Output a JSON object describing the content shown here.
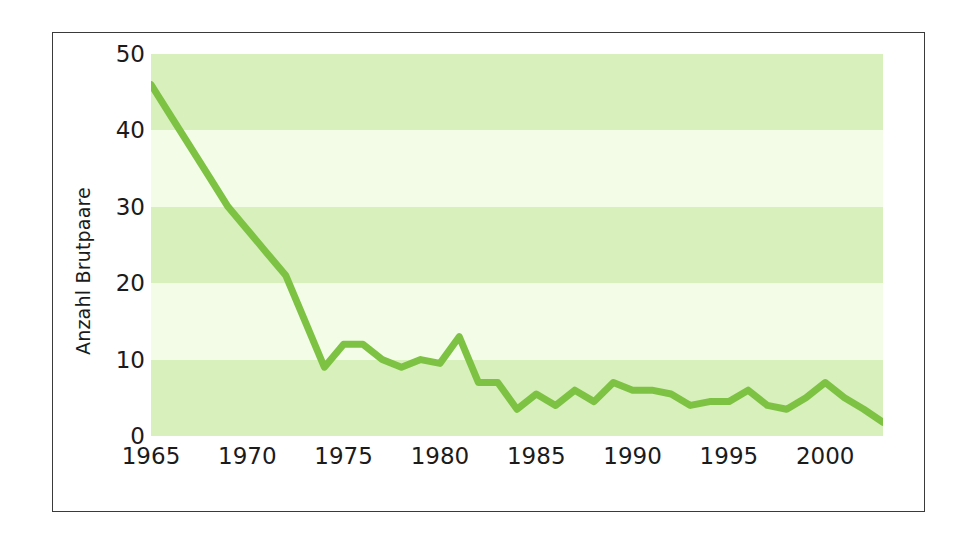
{
  "chart_data": {
    "type": "line",
    "title": "",
    "xlabel": "",
    "ylabel": "Anzahl Brutpaare",
    "xlim": [
      1965,
      2003
    ],
    "ylim": [
      0,
      50
    ],
    "ytick_values": [
      0,
      10,
      20,
      30,
      40,
      50
    ],
    "ytick_labels": [
      "0",
      "10",
      "20",
      "30",
      "40",
      "50"
    ],
    "xtick_values": [
      1965,
      1970,
      1975,
      1980,
      1985,
      1990,
      1995,
      2000
    ],
    "xtick_labels": [
      "1965",
      "1970",
      "1975",
      "1980",
      "1985",
      "1990",
      "1995",
      "2000"
    ],
    "grid": false,
    "banded_background": true,
    "band_interval": 10,
    "legend": null,
    "x": [
      1965,
      1966,
      1967,
      1968,
      1969,
      1970,
      1971,
      1972,
      1973,
      1974,
      1975,
      1976,
      1977,
      1978,
      1979,
      1980,
      1981,
      1982,
      1983,
      1984,
      1985,
      1986,
      1987,
      1988,
      1989,
      1990,
      1991,
      1992,
      1993,
      1994,
      1995,
      1996,
      1997,
      1998,
      1999,
      2000,
      2001,
      2002,
      2003
    ],
    "series": [
      {
        "name": "Anzahl Brutpaare",
        "color": "#7DC242",
        "line_width": 7,
        "values": [
          46,
          42,
          38,
          34,
          30,
          27,
          24,
          21,
          15,
          9,
          12,
          12,
          10,
          9,
          10,
          9.5,
          13,
          7,
          7,
          3.5,
          5.5,
          4,
          6,
          4.5,
          7,
          6,
          6,
          5.5,
          4,
          4.5,
          4.5,
          6,
          4,
          3.5,
          5,
          7,
          5,
          3.5,
          1.8
        ]
      }
    ],
    "colors": {
      "line": "#7DC242",
      "band_dark": "#D8F0BC",
      "band_light": "#F2FCE6",
      "frame": "#3a3a3a",
      "text": "#1b1b1b",
      "background": "#ffffff"
    }
  }
}
